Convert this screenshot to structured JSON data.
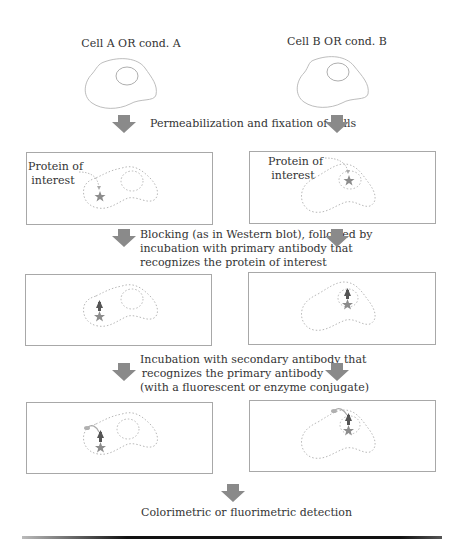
{
  "diagram": {
    "columns": {
      "left_title": "Cell A OR cond. A",
      "right_title": "Cell B OR cond. B"
    },
    "steps": [
      {
        "text": "Permeabilization and fixation of cells"
      },
      {
        "lines": [
          "Blocking (as in Western blot), followed by",
          "incubation with primary antibody that",
          "recognizes the protein of interest"
        ]
      },
      {
        "lines": [
          "Incubation with secondary antibody that",
          "recognizes the primary antibody",
          "(with a fluorescent or enzyme conjugate)"
        ]
      },
      {
        "text": "Colorimetric or fluorimetric detection"
      }
    ],
    "panels": {
      "row1": {
        "left_label_lines": [
          "Protein of",
          "interest"
        ],
        "right_label_lines": [
          "Protein of",
          "interest"
        ]
      }
    },
    "icons": {
      "arrow": "down-arrow-icon",
      "protein": "star-icon",
      "primary_antibody": "primary-antibody-icon",
      "secondary_antibody": "secondary-antibody-icon"
    },
    "colors": {
      "arrow": "#8a8a8a",
      "cell_outline": "#b5b5b5",
      "dotted_outline": "#b8b8b8",
      "star": "#8c8c8c",
      "antibody": "#555555",
      "text": "#333333"
    }
  }
}
